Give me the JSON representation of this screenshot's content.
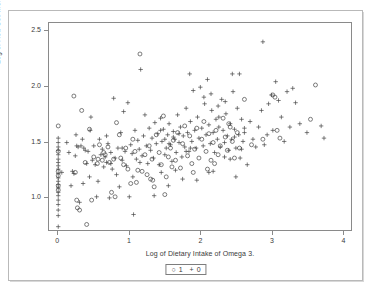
{
  "chart_data": {
    "type": "scatter",
    "title": "",
    "xlabel": "Log of Dietary Intake of Omega 3.",
    "ylabel": "Log of Red Cell Membrance Omega 3",
    "xlim": [
      -0.13,
      4.12
    ],
    "ylim": [
      0.7,
      2.57
    ],
    "xticks": [
      "0",
      "1",
      "2",
      "3",
      "4"
    ],
    "xtick_values": [
      0,
      1,
      2,
      3,
      4
    ],
    "yticks": [
      "1.0",
      "1.5",
      "2.0",
      "2.5"
    ],
    "ytick_values": [
      1.0,
      1.5,
      2.0,
      2.5
    ],
    "grid": false,
    "legend_position": "below-axis",
    "series": [
      {
        "name": "1",
        "marker": "circle",
        "color": "#444444",
        "points": [
          [
            0.0,
            1.64
          ],
          [
            0.0,
            1.41
          ],
          [
            0.0,
            1.23
          ],
          [
            0.0,
            1.19
          ],
          [
            0.0,
            1.1
          ],
          [
            0.0,
            1.06
          ],
          [
            0.22,
            1.91
          ],
          [
            0.24,
            1.22
          ],
          [
            0.26,
            0.97
          ],
          [
            0.27,
            0.9
          ],
          [
            0.3,
            0.88
          ],
          [
            0.33,
            1.78
          ],
          [
            0.38,
            1.31
          ],
          [
            0.4,
            0.75
          ],
          [
            0.44,
            1.61
          ],
          [
            0.47,
            0.97
          ],
          [
            0.5,
            1.36
          ],
          [
            0.55,
            1.3
          ],
          [
            0.58,
            1.47
          ],
          [
            0.62,
            1.33
          ],
          [
            0.66,
            1.38
          ],
          [
            0.7,
            1.45
          ],
          [
            0.72,
            1.31
          ],
          [
            0.75,
            1.04
          ],
          [
            0.78,
            1.34
          ],
          [
            0.82,
            1.67
          ],
          [
            0.86,
            1.56
          ],
          [
            0.88,
            1.35
          ],
          [
            0.92,
            1.29
          ],
          [
            0.95,
            1.44
          ],
          [
            0.98,
            1.25
          ],
          [
            1.02,
            1.12
          ],
          [
            1.05,
            1.52
          ],
          [
            1.08,
            1.41
          ],
          [
            1.12,
            1.24
          ],
          [
            1.15,
            2.29
          ],
          [
            1.18,
            1.23
          ],
          [
            1.22,
            1.38
          ],
          [
            1.25,
            1.2
          ],
          [
            1.28,
            1.46
          ],
          [
            1.32,
            1.34
          ],
          [
            1.35,
            1.09
          ],
          [
            1.38,
            1.56
          ],
          [
            1.42,
            1.4
          ],
          [
            1.45,
            1.29
          ],
          [
            1.48,
            1.73
          ],
          [
            1.52,
            1.18
          ],
          [
            1.55,
            1.36
          ],
          [
            1.58,
            1.44
          ],
          [
            1.62,
            1.51
          ],
          [
            1.65,
            1.33
          ],
          [
            1.68,
            1.58
          ],
          [
            1.72,
            1.26
          ],
          [
            1.75,
            1.48
          ],
          [
            1.78,
            1.64
          ],
          [
            1.82,
            1.37
          ],
          [
            1.85,
            1.55
          ],
          [
            1.88,
            1.3
          ],
          [
            1.92,
            1.43
          ],
          [
            1.95,
            1.62
          ],
          [
            1.98,
            1.35
          ],
          [
            2.02,
            1.52
          ],
          [
            2.05,
            1.68
          ],
          [
            2.08,
            1.41
          ],
          [
            2.12,
            1.57
          ],
          [
            2.15,
            1.33
          ],
          [
            2.18,
            1.49
          ],
          [
            2.22,
            1.6
          ],
          [
            2.25,
            1.38
          ],
          [
            2.28,
            1.46
          ],
          [
            2.32,
            1.71
          ],
          [
            2.35,
            1.54
          ],
          [
            2.38,
            1.42
          ],
          [
            2.42,
            1.63
          ],
          [
            2.45,
            1.5
          ],
          [
            2.48,
            1.35
          ],
          [
            2.52,
            1.58
          ],
          [
            2.55,
            1.44
          ],
          [
            2.62,
            1.88
          ],
          [
            2.72,
            1.47
          ],
          [
            2.88,
            1.52
          ],
          [
            3.02,
            1.92
          ],
          [
            3.05,
            1.9
          ],
          [
            3.08,
            1.6
          ],
          [
            3.12,
            1.53
          ],
          [
            3.55,
            1.7
          ],
          [
            3.62,
            2.01
          ],
          [
            0.56,
            1.34
          ],
          [
            0.64,
            1.4
          ],
          [
            1.3,
            1.16
          ],
          [
            1.33,
            1.15
          ],
          [
            1.6,
            1.27
          ],
          [
            1.9,
            1.22
          ],
          [
            2.1,
            1.25
          ],
          [
            2.2,
            1.3
          ],
          [
            2.4,
            1.66
          ],
          [
            0.8,
            1.0
          ],
          [
            1.1,
            1.13
          ],
          [
            1.5,
            1.02
          ]
        ]
      },
      {
        "name": "0",
        "marker": "plus",
        "color": "#444444",
        "points": [
          [
            0.0,
            1.53
          ],
          [
            0.0,
            1.49
          ],
          [
            0.0,
            1.45
          ],
          [
            0.0,
            1.42
          ],
          [
            0.0,
            1.38
          ],
          [
            0.0,
            1.34
          ],
          [
            0.0,
            1.31
          ],
          [
            0.0,
            1.28
          ],
          [
            0.0,
            1.25
          ],
          [
            0.0,
            1.21
          ],
          [
            0.0,
            1.17
          ],
          [
            0.0,
            1.14
          ],
          [
            0.0,
            1.11
          ],
          [
            0.0,
            1.08
          ],
          [
            0.0,
            1.04
          ],
          [
            0.0,
            1.01
          ],
          [
            0.0,
            0.97
          ],
          [
            0.0,
            0.93
          ],
          [
            0.0,
            0.88
          ],
          [
            0.0,
            0.83
          ],
          [
            0.0,
            0.73
          ],
          [
            0.05,
            1.22
          ],
          [
            0.12,
            1.49
          ],
          [
            0.15,
            1.4
          ],
          [
            0.18,
            1.1
          ],
          [
            0.2,
            1.23
          ],
          [
            0.22,
            1.21
          ],
          [
            0.25,
            1.56
          ],
          [
            0.28,
            1.45
          ],
          [
            0.3,
            0.95
          ],
          [
            0.32,
            1.46
          ],
          [
            0.35,
            1.12
          ],
          [
            0.36,
            1.44
          ],
          [
            0.4,
            1.3
          ],
          [
            0.42,
            1.41
          ],
          [
            0.44,
            1.18
          ],
          [
            0.46,
            1.72
          ],
          [
            0.48,
            1.33
          ],
          [
            0.52,
            1.29
          ],
          [
            0.54,
            1.0
          ],
          [
            0.56,
            1.14
          ],
          [
            0.58,
            1.52
          ],
          [
            0.6,
            1.38
          ],
          [
            0.62,
            1.43
          ],
          [
            0.64,
            1.27
          ],
          [
            0.66,
            1.36
          ],
          [
            0.68,
            1.31
          ],
          [
            0.7,
            1.48
          ],
          [
            0.72,
            0.99
          ],
          [
            0.74,
            1.4
          ],
          [
            0.76,
            1.25
          ],
          [
            0.78,
            1.89
          ],
          [
            0.8,
            1.35
          ],
          [
            0.82,
            1.2
          ],
          [
            0.84,
            1.44
          ],
          [
            0.86,
            1.09
          ],
          [
            0.88,
            1.58
          ],
          [
            0.9,
            1.33
          ],
          [
            0.92,
            1.77
          ],
          [
            0.94,
            1.41
          ],
          [
            0.96,
            1.28
          ],
          [
            0.98,
            1.85
          ],
          [
            1.0,
            1.0
          ],
          [
            1.02,
            1.47
          ],
          [
            1.04,
            1.39
          ],
          [
            1.06,
            0.84
          ],
          [
            1.08,
            1.6
          ],
          [
            1.1,
            1.34
          ],
          [
            1.12,
            1.51
          ],
          [
            1.14,
            1.43
          ],
          [
            1.16,
            2.15
          ],
          [
            1.18,
            1.37
          ],
          [
            1.2,
            1.55
          ],
          [
            1.22,
            1.74
          ],
          [
            1.24,
            1.46
          ],
          [
            1.26,
            1.3
          ],
          [
            1.28,
            1.62
          ],
          [
            1.3,
            1.42
          ],
          [
            1.32,
            1.53
          ],
          [
            1.34,
            1.35
          ],
          [
            1.36,
            1.67
          ],
          [
            1.38,
            1.48
          ],
          [
            1.4,
            1.57
          ],
          [
            1.42,
            1.29
          ],
          [
            1.44,
            1.71
          ],
          [
            1.46,
            1.5
          ],
          [
            1.48,
            1.61
          ],
          [
            1.5,
            1.38
          ],
          [
            1.52,
            1.44
          ],
          [
            1.54,
            1.56
          ],
          [
            1.56,
            1.66
          ],
          [
            1.58,
            1.47
          ],
          [
            1.6,
            1.32
          ],
          [
            1.62,
            1.59
          ],
          [
            1.64,
            1.52
          ],
          [
            1.66,
            1.4
          ],
          [
            1.68,
            1.74
          ],
          [
            1.7,
            1.49
          ],
          [
            1.72,
            1.63
          ],
          [
            1.74,
            1.36
          ],
          [
            1.76,
            1.55
          ],
          [
            1.78,
            1.45
          ],
          [
            1.8,
            1.8
          ],
          [
            1.82,
            1.58
          ],
          [
            1.84,
            1.41
          ],
          [
            1.86,
            1.68
          ],
          [
            1.88,
            1.5
          ],
          [
            1.9,
            1.96
          ],
          [
            1.92,
            1.6
          ],
          [
            1.94,
            1.44
          ],
          [
            1.96,
            1.72
          ],
          [
            1.98,
            1.53
          ],
          [
            2.0,
            1.99
          ],
          [
            2.02,
            1.62
          ],
          [
            2.04,
            1.46
          ],
          [
            2.06,
            1.84
          ],
          [
            2.08,
            1.56
          ],
          [
            2.1,
            2.06
          ],
          [
            2.12,
            1.65
          ],
          [
            2.14,
            1.48
          ],
          [
            2.16,
            1.78
          ],
          [
            2.18,
            1.58
          ],
          [
            2.2,
            1.4
          ],
          [
            2.22,
            1.7
          ],
          [
            2.24,
            1.52
          ],
          [
            2.26,
            1.63
          ],
          [
            2.28,
            1.45
          ],
          [
            2.3,
            1.88
          ],
          [
            2.32,
            1.6
          ],
          [
            2.34,
            1.49
          ],
          [
            2.36,
            1.75
          ],
          [
            2.38,
            1.55
          ],
          [
            2.4,
            1.42
          ],
          [
            2.42,
            1.66
          ],
          [
            2.44,
            1.52
          ],
          [
            2.46,
            1.95
          ],
          [
            2.48,
            1.61
          ],
          [
            2.5,
            1.44
          ],
          [
            2.52,
            1.8
          ],
          [
            2.54,
            1.56
          ],
          [
            2.56,
            1.35
          ],
          [
            2.58,
            1.7
          ],
          [
            2.6,
            1.5
          ],
          [
            2.62,
            1.62
          ],
          [
            1.85,
            2.11
          ],
          [
            2.05,
            1.9
          ],
          [
            2.15,
            1.93
          ],
          [
            2.25,
            1.82
          ],
          [
            2.35,
            1.86
          ],
          [
            2.45,
            2.11
          ],
          [
            2.55,
            2.11
          ],
          [
            2.5,
            1.18
          ],
          [
            2.58,
            1.43
          ],
          [
            2.62,
            1.58
          ],
          [
            2.66,
            1.29
          ],
          [
            2.7,
            1.68
          ],
          [
            2.74,
            1.52
          ],
          [
            2.78,
            1.45
          ],
          [
            2.82,
            1.63
          ],
          [
            2.86,
            1.78
          ],
          [
            2.88,
            2.4
          ],
          [
            2.9,
            1.47
          ],
          [
            2.94,
            1.56
          ],
          [
            2.96,
            1.84
          ],
          [
            3.0,
            1.92
          ],
          [
            3.02,
            1.6
          ],
          [
            3.06,
            2.04
          ],
          [
            3.1,
            1.87
          ],
          [
            3.14,
            1.72
          ],
          [
            3.18,
            1.5
          ],
          [
            3.22,
            1.95
          ],
          [
            3.26,
            1.63
          ],
          [
            3.3,
            1.98
          ],
          [
            3.34,
            1.85
          ],
          [
            3.4,
            1.66
          ],
          [
            3.5,
            1.58
          ],
          [
            3.7,
            1.64
          ],
          [
            3.74,
            1.53
          ],
          [
            0.34,
            1.52
          ],
          [
            0.5,
            1.46
          ],
          [
            0.9,
            1.44
          ],
          [
            1.05,
            1.18
          ],
          [
            1.15,
            1.31
          ],
          [
            1.35,
            1.01
          ],
          [
            1.45,
            1.22
          ],
          [
            1.55,
            1.1
          ],
          [
            1.65,
            1.24
          ],
          [
            1.75,
            1.16
          ],
          [
            1.95,
            1.15
          ],
          [
            2.12,
            1.22
          ],
          [
            2.18,
            1.23
          ],
          [
            0.24,
            1.37
          ],
          [
            0.26,
            1.46
          ],
          [
            0.38,
            1.42
          ],
          [
            0.45,
            1.6
          ],
          [
            0.68,
            1.55
          ],
          [
            0.74,
            1.3
          ],
          [
            1.44,
            1.6
          ],
          [
            1.5,
            1.52
          ],
          [
            1.56,
            1.48
          ],
          [
            1.62,
            1.54
          ],
          [
            1.7,
            1.57
          ],
          [
            1.8,
            1.41
          ],
          [
            1.86,
            1.44
          ],
          [
            2.26,
            1.72
          ],
          [
            2.34,
            1.36
          ],
          [
            2.42,
            1.34
          ],
          [
            2.48,
            1.54
          ]
        ]
      }
    ],
    "legend": [
      {
        "marker": "circle",
        "label": "1"
      },
      {
        "marker": "plus",
        "label": "0"
      }
    ]
  },
  "axes": {
    "y_title": "Log of Red Cell Membrance Omega 3",
    "x_title": "Log of Dietary Intake of Omega 3."
  },
  "colors": {
    "marker": "#444444",
    "axis": "#8a8a8a",
    "outer_border": "#b9b9b9",
    "text": "#3a3a3a"
  }
}
